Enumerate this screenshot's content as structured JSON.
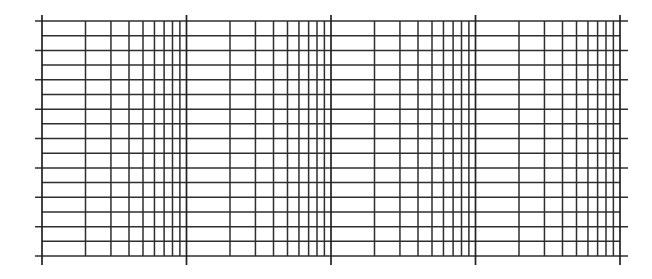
{
  "figure": {
    "type": "semi-log graph paper",
    "canvas": {
      "width": 652,
      "height": 279
    },
    "line_color": "#2e2e2e",
    "background": "#ffffff"
  },
  "grid": {
    "x_axis": {
      "scale": "log",
      "decades": 4,
      "left_px": 42,
      "right_px": 620,
      "minor_per_decade": [
        1,
        2,
        3,
        4,
        5,
        6,
        7,
        8,
        9
      ],
      "major_tick_top_px": 15,
      "major_tick_bottom_px": 265
    },
    "y_axis": {
      "scale": "linear",
      "line_count": 17,
      "top_px": 21,
      "bottom_px": 256,
      "extended_every": 2,
      "extension_left_px": 35,
      "extension_right_px": 628
    }
  }
}
